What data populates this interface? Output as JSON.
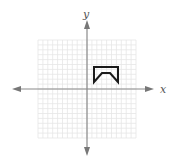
{
  "diagram": {
    "type": "coordinate-plane",
    "axes": {
      "x_label": "x",
      "y_label": "y",
      "origin_px": [
        87,
        89
      ],
      "axis_color": "#8a8a8a",
      "arrow_color": "#777777"
    },
    "grid": {
      "x_range": [
        -10,
        10
      ],
      "y_range": [
        -10,
        10
      ],
      "unit_px": 4.9,
      "minor_color": "#e6e6e6",
      "extent_px": {
        "left": 36,
        "right": 136,
        "top": 42,
        "bottom": 140
      }
    },
    "shape": {
      "name": "notched-pentagon-outline",
      "stroke_color": "#1a1a1a",
      "stroke_width": 2,
      "vertices_px": [
        [
          94,
          67
        ],
        [
          118,
          67
        ],
        [
          118,
          82
        ],
        [
          110,
          73
        ],
        [
          102,
          73
        ],
        [
          94,
          82
        ]
      ],
      "vertices_units_approx": [
        [
          1.5,
          4.5
        ],
        [
          6.5,
          4.5
        ],
        [
          6.5,
          1.5
        ],
        [
          5,
          3.5
        ],
        [
          3,
          3.5
        ],
        [
          1.5,
          1.5
        ]
      ]
    }
  }
}
